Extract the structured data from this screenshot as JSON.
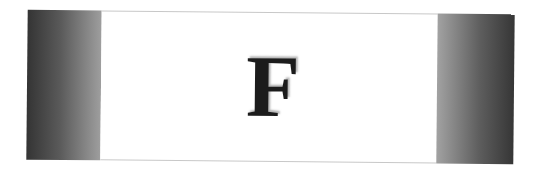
{
  "card": {
    "letter": "F"
  },
  "colors": {
    "letter": "#1c1c1c",
    "panel_dark": "#343434",
    "panel_light": "#a0a0a0",
    "background": "#ffffff",
    "border": "#c8c8c8"
  }
}
